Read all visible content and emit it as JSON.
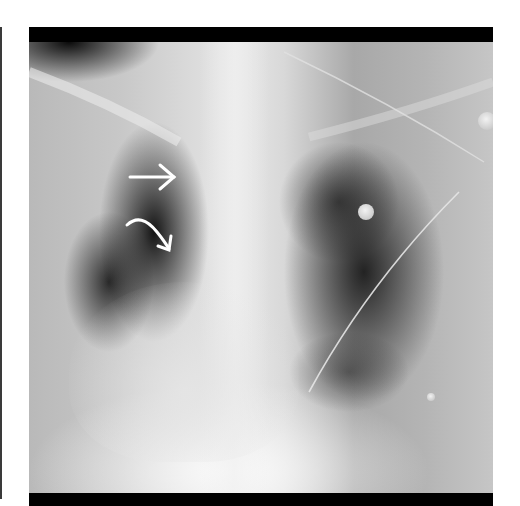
{
  "image": {
    "type": "chest-radiograph",
    "view": "frontal",
    "background_color": "#ffffff",
    "frame_color": "#000000"
  },
  "annotations": [
    {
      "kind": "straight-arrow",
      "color": "#ffffff",
      "pointing": "right"
    },
    {
      "kind": "curved-arrow",
      "color": "#ffffff",
      "pointing": "down-right"
    }
  ],
  "markers": [
    {
      "kind": "round-electrode"
    },
    {
      "kind": "round-electrode"
    },
    {
      "kind": "small-dot"
    }
  ],
  "lines": [
    {
      "kind": "monitoring-wire"
    },
    {
      "kind": "monitoring-wire"
    }
  ]
}
